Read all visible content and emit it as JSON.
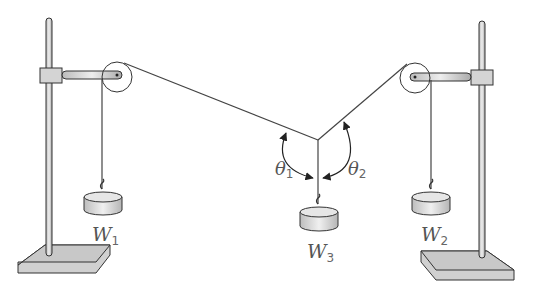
{
  "diagram": {
    "type": "force-table-setup",
    "labels": {
      "w1": "W",
      "w1_sub": "1",
      "w2": "W",
      "w2_sub": "2",
      "w3": "W",
      "w3_sub": "3",
      "theta1": "θ",
      "theta1_sub": "1",
      "theta2": "θ",
      "theta2_sub": "2"
    },
    "colors": {
      "stroke": "#333333",
      "fill_metal": "#d8d8d8",
      "fill_base": "#cfcfcf",
      "string": "#555555"
    }
  }
}
